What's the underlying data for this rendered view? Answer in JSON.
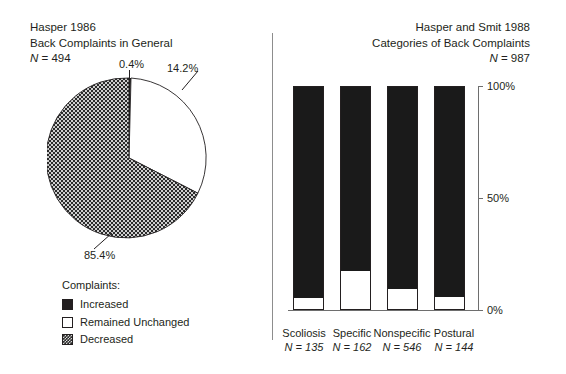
{
  "left_panel": {
    "title_line1": "Hasper 1986",
    "title_line2": "Back Complaints in General",
    "n_prefix": "N",
    "n_value": " = 494"
  },
  "right_panel": {
    "title_line1": "Hasper and Smit 1988",
    "title_line2": "Categories of Back Complaints",
    "n_prefix": "N",
    "n_value": " = 987"
  },
  "legend": {
    "heading": "Complaints:",
    "items": [
      {
        "label": "Increased",
        "swatch": "black"
      },
      {
        "label": "Remained Unchanged",
        "swatch": "white"
      },
      {
        "label": "Decreased",
        "swatch": "dotted"
      }
    ]
  },
  "chart_data": [
    {
      "type": "pie",
      "title": "Back Complaints in General",
      "subtitle": "Hasper 1986",
      "n": 494,
      "categories": [
        "Increased",
        "Remained Unchanged",
        "Decreased"
      ],
      "values": [
        0.4,
        14.2,
        85.4
      ],
      "labels": [
        "0.4%",
        "14.2%",
        "85.4%"
      ],
      "fills": [
        "#1a1a1a",
        "#ffffff",
        "dotted-dark"
      ],
      "legend_position": "below",
      "start_angle_deg": 0,
      "direction": "clockwise"
    },
    {
      "type": "bar",
      "subtype": "stacked-100",
      "title": "Categories of Back Complaints",
      "subtitle": "Hasper and Smit 1988",
      "n": 987,
      "categories": [
        "Scoliosis",
        "Specific",
        "Nonspecific",
        "Postural"
      ],
      "category_n": [
        "N = 135",
        "N = 162",
        "N = 546",
        "N = 144"
      ],
      "series": [
        {
          "name": "Remained Unchanged",
          "fill": "#ffffff",
          "values": [
            5,
            17,
            9,
            5.5
          ]
        },
        {
          "name": "Increased",
          "fill": "#1a1a1a",
          "values": [
            95,
            83,
            91,
            94.5
          ]
        }
      ],
      "ylabel": "",
      "xlabel": "",
      "ylim": [
        0,
        100
      ],
      "yticks": [
        0,
        50,
        100
      ],
      "ytick_labels": [
        "0%",
        "50%",
        "100%"
      ],
      "grid": false,
      "legend_position": "none"
    }
  ]
}
